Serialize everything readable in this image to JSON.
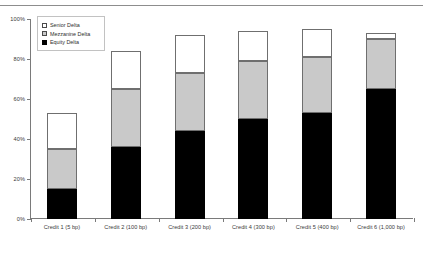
{
  "chart_data": {
    "type": "bar",
    "stacked": true,
    "title": "",
    "xlabel": "",
    "ylabel": "",
    "ylim": [
      0,
      100
    ],
    "ytick_labels": [
      "0%",
      "20%",
      "40%",
      "60%",
      "80%",
      "100%"
    ],
    "ytick_values": [
      0,
      20,
      40,
      60,
      80,
      100
    ],
    "grid": false,
    "legend_position": "top-left",
    "categories": [
      "Credit 1 (5 bp)",
      "Credit 2 (100 bp)",
      "Credit 3 (200 bp)",
      "Credit 4 (300 bp)",
      "Credit 5 (400 bp)",
      "Credit 6 (1,000 bp)"
    ],
    "series": [
      {
        "name": "Equity Delta",
        "color": "#000000",
        "values": [
          15,
          36,
          44,
          50,
          53,
          65
        ]
      },
      {
        "name": "Mezzanine Delta",
        "color": "#c9c9c9",
        "values": [
          20,
          29,
          29,
          29,
          28,
          25
        ]
      },
      {
        "name": "Senior Delta",
        "color": "#ffffff",
        "values": [
          18,
          19,
          19,
          15,
          14,
          3
        ]
      }
    ],
    "cumulative_tops": [
      {
        "equity": 15,
        "mezzanine": 35,
        "senior": 53
      },
      {
        "equity": 36,
        "mezzanine": 65,
        "senior": 84
      },
      {
        "equity": 44,
        "mezzanine": 73,
        "senior": 92
      },
      {
        "equity": 50,
        "mezzanine": 79,
        "senior": 94
      },
      {
        "equity": 53,
        "mezzanine": 81,
        "senior": 95
      },
      {
        "equity": 65,
        "mezzanine": 90,
        "senior": 93
      }
    ]
  },
  "legend": {
    "items": [
      {
        "label": "Senior Delta",
        "swatch": "senior-swatch-icon"
      },
      {
        "label": "Mezzanine Delta",
        "swatch": "mezzanine-swatch-icon"
      },
      {
        "label": "Equity Delta",
        "swatch": "equity-swatch-icon"
      }
    ]
  }
}
